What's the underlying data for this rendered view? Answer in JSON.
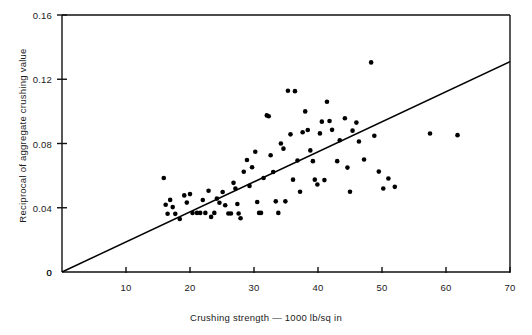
{
  "chart_data": {
    "type": "scatter",
    "title": "",
    "xlabel": "Crushing strength — 1000 lb/sq in",
    "ylabel": "Reciprocal of aggregate crushing value",
    "xlim": [
      0,
      70
    ],
    "ylim": [
      0,
      0.16
    ],
    "xticks": [
      10,
      20,
      30,
      40,
      50,
      60,
      70
    ],
    "xtick_labels": [
      "10",
      "20",
      "30",
      "40",
      "50",
      "60",
      "70"
    ],
    "yticks": [
      0,
      0.04,
      0.08,
      0.12,
      0.16
    ],
    "ytick_labels": [
      "0",
      "0.04",
      "0.08",
      "0.12",
      "0.16"
    ],
    "grid": false,
    "legend": false,
    "origin_label": "0",
    "marker": {
      "shape": "circle",
      "color": "#000000",
      "size_px": 4.6
    },
    "fit_line": {
      "name": "least squares line through origin",
      "color": "#000000",
      "width_px": 1.5,
      "x_start": 0,
      "y_start": 0,
      "x_end": 70,
      "y_end": 0.131
    },
    "series": [
      {
        "name": "aggregate specimens",
        "points": [
          [
            15.9,
            0.0585
          ],
          [
            16.2,
            0.0419
          ],
          [
            16.5,
            0.0363
          ],
          [
            16.9,
            0.0449
          ],
          [
            17.3,
            0.0404
          ],
          [
            17.7,
            0.0362
          ],
          [
            18.4,
            0.033
          ],
          [
            19.1,
            0.0477
          ],
          [
            19.5,
            0.0432
          ],
          [
            20.0,
            0.0485
          ],
          [
            20.4,
            0.0367
          ],
          [
            21.1,
            0.0368
          ],
          [
            21.6,
            0.0368
          ],
          [
            22.0,
            0.0448
          ],
          [
            22.4,
            0.0368
          ],
          [
            22.9,
            0.0506
          ],
          [
            23.3,
            0.0343
          ],
          [
            23.8,
            0.0368
          ],
          [
            24.2,
            0.0457
          ],
          [
            24.6,
            0.0431
          ],
          [
            25.1,
            0.0498
          ],
          [
            25.5,
            0.0416
          ],
          [
            26.0,
            0.0364
          ],
          [
            26.4,
            0.0364
          ],
          [
            26.8,
            0.0555
          ],
          [
            27.1,
            0.052
          ],
          [
            27.4,
            0.0423
          ],
          [
            27.6,
            0.0364
          ],
          [
            27.9,
            0.0335
          ],
          [
            28.4,
            0.0624
          ],
          [
            28.9,
            0.0697
          ],
          [
            29.3,
            0.0536
          ],
          [
            29.7,
            0.0652
          ],
          [
            30.2,
            0.0749
          ],
          [
            30.5,
            0.0436
          ],
          [
            30.8,
            0.0368
          ],
          [
            31.1,
            0.0368
          ],
          [
            31.5,
            0.0585
          ],
          [
            32.0,
            0.0975
          ],
          [
            32.3,
            0.097
          ],
          [
            32.6,
            0.0727
          ],
          [
            33.0,
            0.0623
          ],
          [
            33.4,
            0.044
          ],
          [
            33.8,
            0.0368
          ],
          [
            34.2,
            0.08
          ],
          [
            34.6,
            0.0768
          ],
          [
            34.9,
            0.044
          ],
          [
            35.3,
            0.1128
          ],
          [
            35.7,
            0.0857
          ],
          [
            36.1,
            0.0575
          ],
          [
            36.4,
            0.1126
          ],
          [
            36.8,
            0.0694
          ],
          [
            37.2,
            0.05
          ],
          [
            37.6,
            0.087
          ],
          [
            38.0,
            0.1
          ],
          [
            38.4,
            0.0884
          ],
          [
            38.8,
            0.0757
          ],
          [
            39.2,
            0.069
          ],
          [
            39.5,
            0.0575
          ],
          [
            39.9,
            0.0545
          ],
          [
            40.3,
            0.0863
          ],
          [
            40.6,
            0.0936
          ],
          [
            41.0,
            0.0572
          ],
          [
            41.4,
            0.106
          ],
          [
            41.8,
            0.094
          ],
          [
            42.2,
            0.0885
          ],
          [
            43.0,
            0.069
          ],
          [
            43.4,
            0.082
          ],
          [
            44.2,
            0.0957
          ],
          [
            44.6,
            0.065
          ],
          [
            45.0,
            0.05
          ],
          [
            45.4,
            0.088
          ],
          [
            46.0,
            0.093
          ],
          [
            46.4,
            0.0812
          ],
          [
            47.2,
            0.07
          ],
          [
            48.3,
            0.1305
          ],
          [
            48.8,
            0.0848
          ],
          [
            49.5,
            0.0625
          ],
          [
            50.2,
            0.052
          ],
          [
            51.0,
            0.0582
          ],
          [
            52.0,
            0.053
          ],
          [
            57.5,
            0.0862
          ],
          [
            61.8,
            0.0852
          ]
        ]
      }
    ]
  },
  "axes_geometry": {
    "left_px": 62,
    "right_px": 510,
    "top_px": 15,
    "bottom_px": 272
  }
}
